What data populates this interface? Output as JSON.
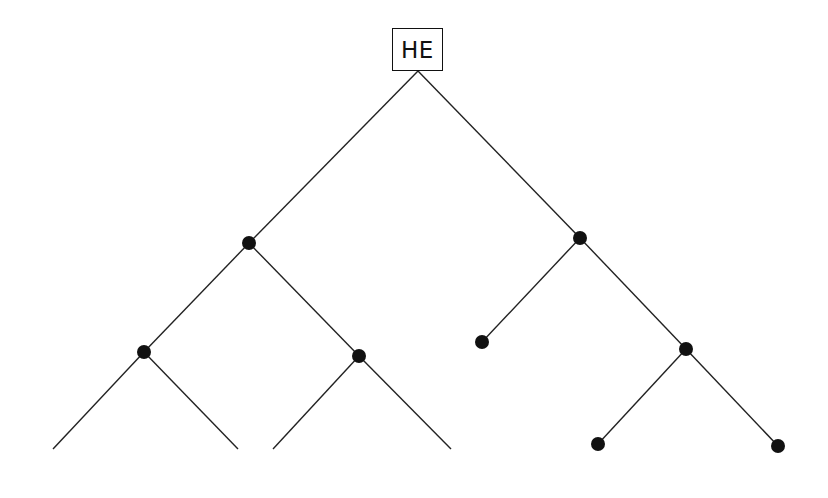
{
  "diagram": {
    "type": "tree",
    "root": {
      "id": "root",
      "label": "HE",
      "box": [
        392,
        28,
        51,
        43
      ],
      "anchor": [
        418,
        71
      ]
    },
    "nodes": [
      {
        "id": "n1",
        "x": 249,
        "y": 243,
        "dot": true
      },
      {
        "id": "n2",
        "x": 580,
        "y": 238,
        "dot": true
      },
      {
        "id": "n3",
        "x": 144,
        "y": 352,
        "dot": true
      },
      {
        "id": "n4",
        "x": 359,
        "y": 356,
        "dot": true
      },
      {
        "id": "n5",
        "x": 482,
        "y": 342,
        "dot": true
      },
      {
        "id": "n6",
        "x": 686,
        "y": 349,
        "dot": true
      },
      {
        "id": "l1",
        "x": 53,
        "y": 449,
        "dot": false
      },
      {
        "id": "l2",
        "x": 238,
        "y": 449,
        "dot": false
      },
      {
        "id": "l3",
        "x": 273,
        "y": 449,
        "dot": false
      },
      {
        "id": "l4",
        "x": 451,
        "y": 449,
        "dot": false
      },
      {
        "id": "n7",
        "x": 598,
        "y": 444,
        "dot": true
      },
      {
        "id": "n8",
        "x": 778,
        "y": 446,
        "dot": true
      }
    ],
    "edges": [
      [
        "root",
        "n1"
      ],
      [
        "root",
        "n2"
      ],
      [
        "n1",
        "n3"
      ],
      [
        "n1",
        "n4"
      ],
      [
        "n2",
        "n5"
      ],
      [
        "n2",
        "n6"
      ],
      [
        "n3",
        "l1"
      ],
      [
        "n3",
        "l2"
      ],
      [
        "n4",
        "l3"
      ],
      [
        "n4",
        "l4"
      ],
      [
        "n6",
        "n7"
      ],
      [
        "n6",
        "n8"
      ]
    ],
    "colors": {
      "line": "#222222",
      "dot": "#111111",
      "background": "#ffffff"
    },
    "dot_radius": 7
  }
}
